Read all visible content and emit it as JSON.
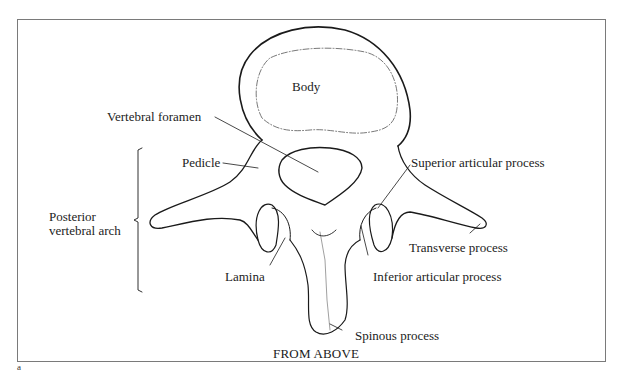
{
  "figure": {
    "caption": "FROM ABOVE",
    "corner_mark": "a",
    "colors": {
      "line": "#1a1a1a",
      "frame": "#7a7a7a",
      "background": "#ffffff"
    }
  },
  "labels": {
    "body": "Body",
    "vertebral_foramen": "Vertebral foramen",
    "pedicle": "Pedicle",
    "superior_articular_process": "Superior articular process",
    "posterior_vertebral_arch_line1": "Posterior",
    "posterior_vertebral_arch_line2": "vertebral arch",
    "transverse_process": "Transverse process",
    "lamina": "Lamina",
    "inferior_articular_process": "Inferior articular process",
    "spinous_process": "Spinous process"
  }
}
